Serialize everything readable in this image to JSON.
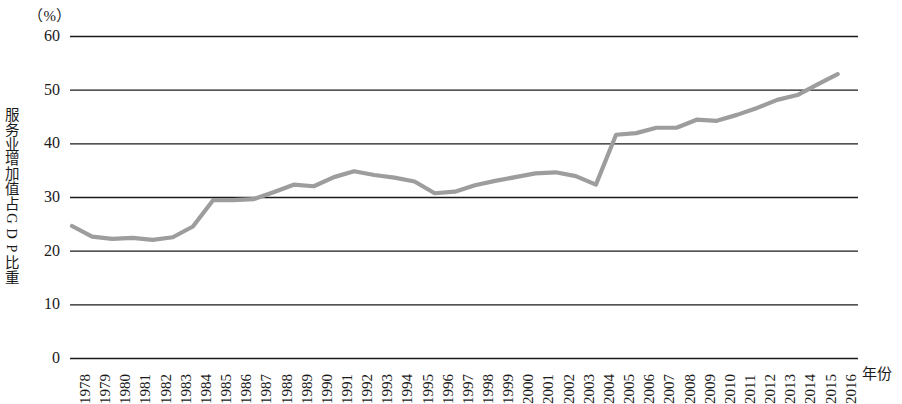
{
  "chart_data": {
    "type": "line",
    "title": "",
    "subtitle": "",
    "unit_label": "（%）",
    "xlabel": "年份",
    "ylabel": "服务业增加值占GDP比重",
    "ylim": [
      0,
      60
    ],
    "y_ticks": [
      60,
      50,
      40,
      30,
      20,
      10,
      0
    ],
    "grid": true,
    "legend": "none",
    "line_color": "#9d9d9d",
    "axis_color": "#1a1a1a",
    "categories": [
      "1978",
      "1979",
      "1980",
      "1981",
      "1982",
      "1983",
      "1984",
      "1985",
      "1986",
      "1987",
      "1988",
      "1989",
      "1990",
      "1991",
      "1992",
      "1993",
      "1994",
      "1995",
      "1996",
      "1997",
      "1998",
      "1999",
      "2000",
      "2001",
      "2002",
      "2003",
      "2004",
      "2005",
      "2006",
      "2007",
      "2008",
      "2009",
      "2010",
      "2011",
      "2012",
      "2013",
      "2014",
      "2015",
      "2016"
    ],
    "series": [
      {
        "name": "服务业增加值占GDP比重",
        "values": [
          24.6,
          22.6,
          22.2,
          22.4,
          22.0,
          22.5,
          24.5,
          29.4,
          29.4,
          29.6,
          30.9,
          32.3,
          32.0,
          33.7,
          34.8,
          34.1,
          33.6,
          32.9,
          30.7,
          31.0,
          32.2,
          33.0,
          33.7,
          34.4,
          34.6,
          33.9,
          32.3,
          41.6,
          41.9,
          42.9,
          42.9,
          44.4,
          44.2,
          45.3,
          46.6,
          48.1,
          49.0,
          51.0,
          52.9
        ]
      }
    ]
  },
  "y_axis_title_chars": [
    "服",
    "务",
    "业",
    "增",
    "加",
    "值",
    "占",
    "G",
    "D",
    "P",
    "比",
    "重"
  ]
}
